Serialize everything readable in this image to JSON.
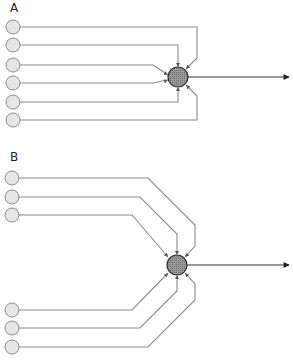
{
  "panels": [
    {
      "label": "A",
      "label_pos": [
        10,
        12
      ],
      "hub": {
        "cx": 178,
        "cy": 77,
        "r": 10
      },
      "output": {
        "x1": 188,
        "y1": 77,
        "x2": 289,
        "y2": 77
      },
      "inputs": [
        {
          "cx": 13,
          "cy": 27,
          "r": 7
        },
        {
          "cx": 13,
          "cy": 45,
          "r": 7
        },
        {
          "cx": 13,
          "cy": 65,
          "r": 7
        },
        {
          "cx": 13,
          "cy": 83,
          "r": 7
        },
        {
          "cx": 13,
          "cy": 102,
          "r": 7
        },
        {
          "cx": 13,
          "cy": 120,
          "r": 7
        }
      ],
      "wires": [
        "M20,27 L197,27 L197,58 L186,69",
        "M20,45 L178,45 L178,66",
        "M20,65 L153,65 L167,74",
        "M20,83 L153,83 L167,80",
        "M20,102 L178,102 L178,88",
        "M20,120 L197,120 L197,96 L186,85"
      ],
      "arrowheads": [
        {
          "x": 186,
          "y": 69,
          "angle": 135
        },
        {
          "x": 178,
          "y": 67,
          "angle": 90
        },
        {
          "x": 168,
          "y": 75,
          "angle": 30
        },
        {
          "x": 168,
          "y": 80,
          "angle": -20
        },
        {
          "x": 178,
          "y": 87,
          "angle": -90
        },
        {
          "x": 186,
          "y": 85,
          "angle": -135
        }
      ]
    },
    {
      "label": "B",
      "label_pos": [
        10,
        161
      ],
      "hub": {
        "cx": 177,
        "cy": 265,
        "r": 10
      },
      "output": {
        "x1": 187,
        "y1": 265,
        "x2": 289,
        "y2": 265
      },
      "inputs": [
        {
          "cx": 12,
          "cy": 178,
          "r": 7
        },
        {
          "cx": 12,
          "cy": 197,
          "r": 7
        },
        {
          "cx": 12,
          "cy": 215,
          "r": 7
        },
        {
          "cx": 12,
          "cy": 310,
          "r": 7
        },
        {
          "cx": 12,
          "cy": 328,
          "r": 7
        },
        {
          "cx": 12,
          "cy": 347,
          "r": 7
        }
      ],
      "wires": [
        "M19,178 L148,178 L195,225 L195,246 L185,257",
        "M19,197 L140,197 L177,234 L177,254",
        "M19,215 L132,215 L168,257",
        "M19,310 L132,310 L168,273",
        "M19,328 L140,328 L177,291 L177,276",
        "M19,347 L148,347 L195,300 L195,284 L185,273"
      ],
      "arrowheads": [
        {
          "x": 185,
          "y": 257,
          "angle": 135
        },
        {
          "x": 177,
          "y": 255,
          "angle": 90
        },
        {
          "x": 168,
          "y": 257,
          "angle": 50
        },
        {
          "x": 168,
          "y": 273,
          "angle": -50
        },
        {
          "x": 177,
          "y": 275,
          "angle": -90
        },
        {
          "x": 185,
          "y": 273,
          "angle": -135
        }
      ]
    }
  ],
  "colors": {
    "input_fill": "#e6e6e6",
    "input_stroke": "#8c8c8c",
    "wire": "#8a8a8a",
    "hub_fill": "#8f8f8f",
    "hub_stroke": "#2a2a2a",
    "output": "#333333"
  }
}
